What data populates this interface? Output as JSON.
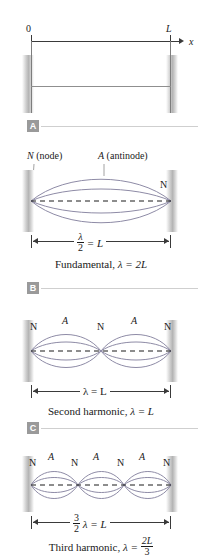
{
  "figure": {
    "axis": {
      "origin_label": "0",
      "length_label": "L",
      "axis_name": "x"
    },
    "curve_color": "#8e8ba6",
    "wall_color": "#c4c4c4",
    "panels": [
      {
        "id": "A",
        "badge": "A",
        "mode": "rest",
        "loops": 0,
        "node_labels": [],
        "antinode_labels": [],
        "callouts": [],
        "dimension": null,
        "caption": null
      },
      {
        "id": "B",
        "badge": "B",
        "mode": "fundamental",
        "loops": 1,
        "node_labels": [
          "N"
        ],
        "antinode_labels": [],
        "callouts": [
          {
            "text": "N (node)",
            "italic_head": "N"
          },
          {
            "text": "A (antinode)",
            "italic_head": "A"
          }
        ],
        "dimension": {
          "numerator": "λ",
          "denominator": "2",
          "relation": "= L"
        },
        "caption": {
          "name": "Fundamental,",
          "equation": "λ = 2L"
        }
      },
      {
        "id": "C",
        "badge": "B",
        "mode": "second-harmonic",
        "loops": 2,
        "node_labels": [
          "N",
          "N",
          "N"
        ],
        "antinode_labels": [
          "A",
          "A"
        ],
        "callouts": [],
        "dimension": {
          "numerator": "",
          "denominator": "",
          "relation": "λ = L"
        },
        "caption": {
          "name": "Second harmonic,",
          "equation": "λ = L"
        }
      },
      {
        "id": "D",
        "badge": "C",
        "mode": "third-harmonic",
        "loops": 3,
        "node_labels": [
          "N",
          "N",
          "N",
          "N"
        ],
        "antinode_labels": [
          "A",
          "A",
          "A"
        ],
        "callouts": [],
        "dimension": {
          "numerator": "3",
          "denominator": "2",
          "relation": "λ = L"
        },
        "caption": {
          "name": "Third harmonic,",
          "equation_lead": "λ =",
          "frac_num": "2L",
          "frac_den": "3"
        }
      }
    ],
    "badges": {
      "a": "A",
      "b": "B",
      "c": "C"
    },
    "labels": {
      "N": "N",
      "A": "A",
      "node_callout_letter": "N",
      "node_callout_word": "(node)",
      "antinode_callout_letter": "A",
      "antinode_callout_word": "(antinode)",
      "lambda": "λ",
      "equals_L": "= L",
      "two": "2",
      "three": "3",
      "fundamental_name": "Fundamental,",
      "fundamental_eq": "λ = 2L",
      "second_name": "Second harmonic,",
      "second_eq": "λ = L",
      "third_name": "Third harmonic,",
      "third_eq_lead": "λ =",
      "third_num": "2L",
      "third_den": "3",
      "lambda_eq_L": "λ = L"
    }
  }
}
